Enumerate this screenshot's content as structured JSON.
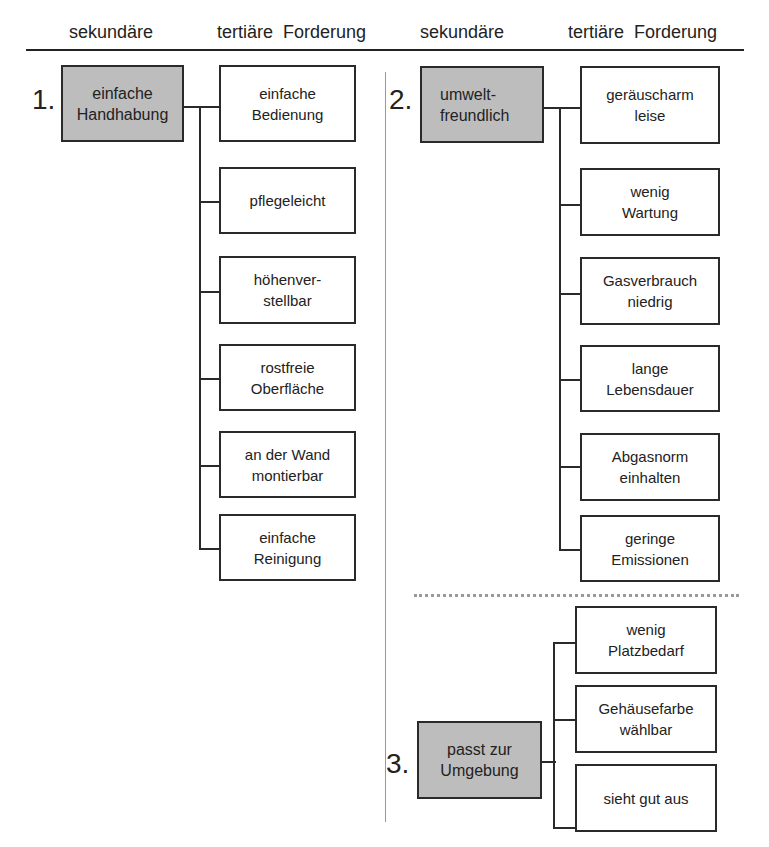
{
  "header": {
    "col_left_secondary": "sekundäre",
    "col_left_tertiary": "tertiäre  Forderung",
    "col_right_secondary": "sekundäre",
    "col_right_tertiary": "tertiäre  Forderung"
  },
  "groups": [
    {
      "number": "1.",
      "secondary": "einfache\nHandhabung",
      "tertiary": [
        "einfache\nBedienung",
        "pflegeleicht",
        "höhenver-\nstellbar",
        "rostfreie\nOberfläche",
        "an der Wand\nmontierbar",
        "einfache\nReinigung"
      ]
    },
    {
      "number": "2.",
      "secondary": "umwelt-\nfreundlich",
      "tertiary": [
        "geräuscharm\nleise",
        "wenig\nWartung",
        "Gasverbrauch\nniedrig",
        "lange\nLebensdauer",
        "Abgasnorm\neinhalten",
        "geringe\nEmissionen"
      ]
    },
    {
      "number": "3.",
      "secondary": "passt zur\nUmgebung",
      "tertiary": [
        "wenig\nPlatzbedarf",
        "Gehäusefarbe\nwählbar",
        "sieht gut aus"
      ]
    }
  ],
  "colors": {
    "secondary_fill": "#bdbdbd",
    "line": "#2a2a2a",
    "divider": "#999999"
  }
}
